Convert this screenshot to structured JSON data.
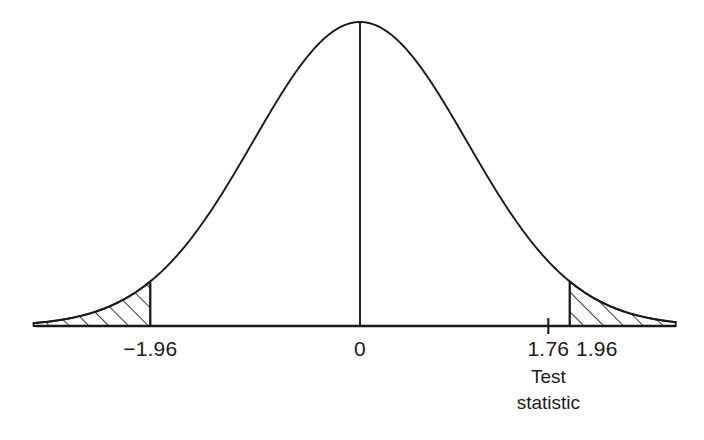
{
  "chart_data": {
    "type": "line",
    "title": "",
    "subtitle": "",
    "xlabel": "",
    "ylabel": "",
    "distribution": "standard normal",
    "mean": 0,
    "sd": 1,
    "xlim": [
      -3.05,
      2.95
    ],
    "ylim": [
      0,
      0.4
    ],
    "grid": false,
    "legend": null,
    "x": [
      -3,
      -2.75,
      -2.5,
      -2.25,
      -2,
      -1.96,
      -1.75,
      -1.5,
      -1.25,
      -1,
      -0.75,
      -0.5,
      -0.25,
      0,
      0.25,
      0.5,
      0.75,
      1,
      1.25,
      1.5,
      1.75,
      1.76,
      1.96,
      2,
      2.25,
      2.5,
      2.75,
      3
    ],
    "y": [
      0.0044,
      0.0091,
      0.0175,
      0.0317,
      0.054,
      0.0584,
      0.0863,
      0.1295,
      0.1826,
      0.242,
      0.3011,
      0.3521,
      0.3867,
      0.3989,
      0.3867,
      0.3521,
      0.3011,
      0.242,
      0.1826,
      0.1295,
      0.0863,
      0.0848,
      0.0584,
      0.054,
      0.0317,
      0.0175,
      0.0091,
      0.0044
    ],
    "center_line_at": 0,
    "shaded_regions": [
      {
        "name": "left-rejection-region",
        "from": -3.05,
        "to": -1.96,
        "hatch": "diagonal-up-right"
      },
      {
        "name": "right-rejection-region",
        "from": 1.96,
        "to": 2.95,
        "hatch": "diagonal-up-right"
      }
    ],
    "critical_values": [
      -1.96,
      1.96
    ],
    "test_statistic": 1.76,
    "tick_values": [
      -1.96,
      0,
      1.76,
      1.96
    ],
    "tick_labels": [
      "−1.96",
      "0",
      "1.76",
      "1.96"
    ],
    "annotations": [
      {
        "name": "test-statistic-annotation",
        "at": 1.76,
        "lines": [
          "Test",
          "statistic"
        ]
      }
    ]
  },
  "axis": {
    "labels": {
      "left_critical": "−1.96",
      "center": "0",
      "test_statistic": "1.76",
      "right_critical": "1.96"
    }
  },
  "annotation": {
    "test_statistic_line1": "Test",
    "test_statistic_line2": "statistic"
  },
  "colors": {
    "background": "#ffffff",
    "curve": "#1a1a1a",
    "axis": "#1a1a1a",
    "hatch": "#1a1a1a",
    "text": "#1a1a1a"
  }
}
